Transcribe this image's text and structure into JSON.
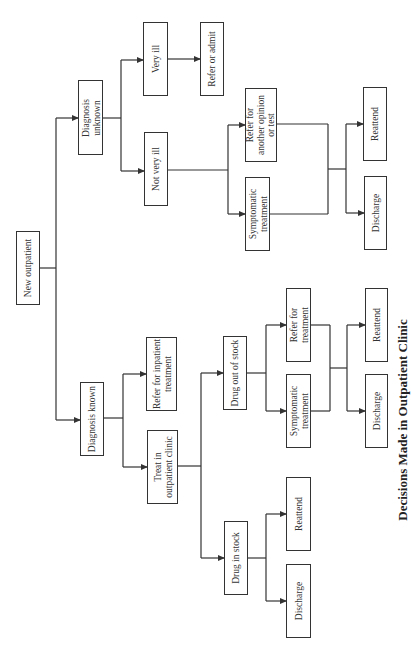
{
  "diagram": {
    "title": "Decisions Made in Outpatient Clinic",
    "orientation": "rotated-90-ccw",
    "colors": {
      "line": "#333333",
      "box_border": "#333333",
      "background": "#ffffff"
    },
    "nodes": {
      "new_outpatient": "New outpatient",
      "diagnosis_unknown": "Diagnosis\nunknown",
      "diagnosis_known": "Diagnosis known",
      "very_ill": "Very ill",
      "not_very_ill": "Not very ill",
      "refer_or_admit": "Refer or admit",
      "refer_inpatient": "Refer for inpatient\ntreatment",
      "treat_outpatient": "Treat in\noutpatient clinic",
      "refer_opinion": "Refer for\nanother opinion\nor test",
      "symptomatic_unknown": "Symptomatic\ntreatment",
      "reattend_unknown": "Reattend",
      "discharge_unknown": "Discharge",
      "drug_out_of_stock": "Drug out of stock",
      "refer_treatment": "Refer for\ntreatment",
      "symptomatic_oos": "Symptomatic\ntreatment",
      "reattend_oos": "Reattend",
      "discharge_oos": "Discharge",
      "drug_in_stock": "Drug in stock",
      "reattend_instock": "Reattend",
      "discharge_instock": "Discharge"
    },
    "edges": [
      [
        "New outpatient",
        "Diagnosis unknown"
      ],
      [
        "New outpatient",
        "Diagnosis known"
      ],
      [
        "Diagnosis unknown",
        "Very ill"
      ],
      [
        "Diagnosis unknown",
        "Not very ill"
      ],
      [
        "Very ill",
        "Refer or admit"
      ],
      [
        "Not very ill",
        "Refer for another opinion or test"
      ],
      [
        "Not very ill",
        "Symptomatic treatment"
      ],
      [
        "Refer for another opinion or test",
        "Reattend"
      ],
      [
        "Refer for another opinion or test",
        "Discharge"
      ],
      [
        "Symptomatic treatment",
        "Reattend"
      ],
      [
        "Symptomatic treatment",
        "Discharge"
      ],
      [
        "Diagnosis known",
        "Refer for inpatient treatment"
      ],
      [
        "Diagnosis known",
        "Treat in outpatient clinic"
      ],
      [
        "Treat in outpatient clinic",
        "Drug out of stock"
      ],
      [
        "Treat in outpatient clinic",
        "Drug in stock"
      ],
      [
        "Drug out of stock",
        "Refer for treatment"
      ],
      [
        "Drug out of stock",
        "Symptomatic treatment"
      ],
      [
        "Refer for treatment",
        "Reattend"
      ],
      [
        "Refer for treatment",
        "Discharge"
      ],
      [
        "Symptomatic treatment",
        "Reattend"
      ],
      [
        "Symptomatic treatment",
        "Discharge"
      ],
      [
        "Drug in stock",
        "Reattend"
      ],
      [
        "Drug in stock",
        "Discharge"
      ]
    ]
  }
}
